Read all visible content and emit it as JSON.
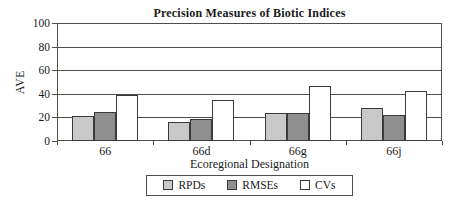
{
  "chart": {
    "title": "Precision Measures of Biotic Indices",
    "y_axis_title": "AVE",
    "x_axis_title": "Ecoregional Designation",
    "line_color": "#4d4d4d",
    "bar_border_color": "#3a3a3a",
    "background_color": "#ffffff"
  },
  "chart_data": {
    "type": "bar",
    "title": "Precision Measures of Biotic Indices",
    "xlabel": "Ecoregional Designation",
    "ylabel": "AVE",
    "ylim": [
      0,
      100
    ],
    "y_tick_step": 20,
    "y_tick_labels": [
      "0",
      "20",
      "40",
      "60",
      "80",
      "100"
    ],
    "grid": true,
    "legend_position": "bottom",
    "categories": [
      "66",
      "66d",
      "66g",
      "66j"
    ],
    "series": [
      {
        "name": "RPDs",
        "color": "#c9c9c9",
        "values": [
          21,
          16,
          24,
          28
        ]
      },
      {
        "name": "RMSEs",
        "color": "#8f8f8f",
        "values": [
          25,
          19,
          24,
          22
        ]
      },
      {
        "name": "CVs",
        "color": "#ffffff",
        "values": [
          39,
          35,
          47,
          42
        ]
      }
    ]
  }
}
